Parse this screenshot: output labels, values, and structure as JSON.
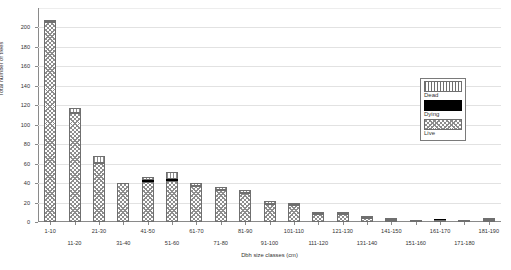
{
  "chart_data": {
    "type": "bar",
    "subtype": "stacked-bar",
    "title": "",
    "xlabel": "Dbh size classes (cm)",
    "ylabel": "Total number of trees",
    "ylim": [
      0,
      220
    ],
    "ytick_labels": [
      "0",
      "20",
      "40",
      "60",
      "80",
      "100",
      "120",
      "140",
      "160",
      "180",
      "200"
    ],
    "ytick_values": [
      0,
      20,
      40,
      60,
      80,
      100,
      120,
      140,
      160,
      180,
      200
    ],
    "grid": "horizontal",
    "legend_position": "right-upper",
    "categories": [
      "1-10",
      "11-20",
      "21-30",
      "31-40",
      "41-50",
      "51-60",
      "61-70",
      "71-80",
      "81-90",
      "91-100",
      "101-110",
      "111-120",
      "121-130",
      "131-140",
      "141-150",
      "151-160",
      "161-170",
      "171-180",
      "181-190"
    ],
    "series": [
      {
        "name": "Live",
        "values": [
          206,
          112,
          61,
          40,
          41,
          42,
          37,
          33,
          30,
          19,
          17,
          8,
          8,
          4,
          2,
          1,
          1,
          0,
          1
        ]
      },
      {
        "name": "Dying",
        "values": [
          0,
          0,
          0,
          0,
          2,
          2,
          0,
          0,
          0,
          0,
          0,
          0,
          0,
          0,
          0,
          0,
          1,
          0,
          0
        ]
      },
      {
        "name": "Dead",
        "values": [
          1,
          5,
          7,
          0,
          3,
          7,
          3,
          3,
          3,
          3,
          3,
          2,
          2,
          1,
          1,
          0,
          0,
          1,
          1
        ]
      }
    ],
    "totals": [
      207,
      117,
      68,
      40,
      46,
      51,
      40,
      36,
      33,
      22,
      20,
      10,
      10,
      5,
      3,
      1,
      2,
      1,
      2
    ],
    "legend": [
      {
        "label": "Dead",
        "pattern": "vertical-stripes"
      },
      {
        "label": "Dying",
        "pattern": "solid-black"
      },
      {
        "label": "Live",
        "pattern": "crosshatch"
      }
    ],
    "colors": {
      "hatch": "#8d8d8d",
      "outline": "#6f6f6f",
      "dying": "#000000",
      "grid": "#e2e2e2",
      "axis": "#8a8a8a",
      "background": "#ffffff",
      "text": "#333333"
    }
  }
}
